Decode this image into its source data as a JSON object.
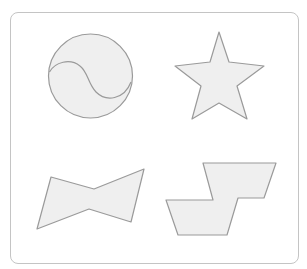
{
  "panel": {
    "border_color": "#c4c4c4",
    "background": "#ffffff"
  },
  "style": {
    "fill": "#efefef",
    "stroke": "#9a9a9a"
  },
  "shapes": [
    {
      "id": "yin-yang-circle",
      "type": "circle-with-s-curve",
      "position": "top-left"
    },
    {
      "id": "star",
      "type": "five-point-star",
      "position": "top-right"
    },
    {
      "id": "bow-tie",
      "type": "bow-tie-polygon",
      "position": "bottom-left"
    },
    {
      "id": "step-shape",
      "type": "stepped-polygon",
      "position": "bottom-right"
    }
  ]
}
